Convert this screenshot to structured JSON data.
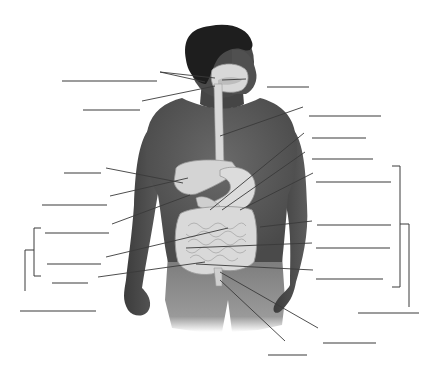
{
  "diagram": {
    "title": "",
    "colors": {
      "background": "#ffffff",
      "skin": "#4a4a4a",
      "shirt": "#5a5a5a",
      "hair": "#1e1e1e",
      "organ": "#d8d8d8",
      "organ_outline": "#9a9a9a",
      "line": "#3a3a3a"
    },
    "blank_labels": {
      "left": [
        {
          "id": "L1",
          "x1": 62,
          "x2": 157,
          "y": 81,
          "text": ""
        },
        {
          "id": "L2",
          "x1": 83,
          "x2": 140,
          "y": 110,
          "text": ""
        },
        {
          "id": "L3",
          "x1": 64,
          "x2": 101,
          "y": 173,
          "text": ""
        },
        {
          "id": "L4",
          "x1": 42,
          "x2": 107,
          "y": 205,
          "text": ""
        },
        {
          "id": "L5",
          "x1": 45,
          "x2": 109,
          "y": 233,
          "text": ""
        },
        {
          "id": "L6",
          "x1": 47,
          "x2": 101,
          "y": 264,
          "text": ""
        },
        {
          "id": "L7",
          "x1": 52,
          "x2": 88,
          "y": 283,
          "text": ""
        },
        {
          "id": "L8",
          "x1": 20,
          "x2": 96,
          "y": 311,
          "text": ""
        }
      ],
      "right": [
        {
          "id": "R1",
          "x1": 267,
          "x2": 309,
          "y": 87,
          "text": ""
        },
        {
          "id": "R2",
          "x1": 309,
          "x2": 381,
          "y": 116,
          "text": ""
        },
        {
          "id": "R3",
          "x1": 312,
          "x2": 366,
          "y": 138,
          "text": ""
        },
        {
          "id": "R4",
          "x1": 312,
          "x2": 373,
          "y": 159,
          "text": ""
        },
        {
          "id": "R5",
          "x1": 316,
          "x2": 391,
          "y": 182,
          "text": ""
        },
        {
          "id": "R6",
          "x1": 317,
          "x2": 391,
          "y": 225,
          "text": ""
        },
        {
          "id": "R7",
          "x1": 316,
          "x2": 390,
          "y": 248,
          "text": ""
        },
        {
          "id": "R8",
          "x1": 316,
          "x2": 383,
          "y": 279,
          "text": ""
        },
        {
          "id": "R9",
          "x1": 358,
          "x2": 419,
          "y": 313,
          "text": ""
        },
        {
          "id": "R10",
          "x1": 323,
          "x2": 376,
          "y": 343,
          "text": ""
        },
        {
          "id": "R11",
          "x1": 268,
          "x2": 307,
          "y": 355,
          "text": ""
        }
      ]
    },
    "leader_lines": [
      {
        "from": [
          160,
          72
        ],
        "to": [
          215,
          78
        ]
      },
      {
        "from": [
          160,
          72
        ],
        "to": [
          205,
          82
        ]
      },
      {
        "from": [
          142,
          101
        ],
        "to": [
          215,
          86
        ]
      },
      {
        "from": [
          106,
          168
        ],
        "to": [
          183,
          183
        ]
      },
      {
        "from": [
          110,
          196
        ],
        "to": [
          188,
          178
        ]
      },
      {
        "from": [
          112,
          224
        ],
        "to": [
          190,
          195
        ]
      },
      {
        "from": [
          106,
          257
        ],
        "to": [
          228,
          228
        ]
      },
      {
        "from": [
          98,
          277
        ],
        "to": [
          205,
          262
        ]
      },
      {
        "from": [
          246,
          79
        ],
        "to": [
          222,
          80
        ]
      },
      {
        "from": [
          303,
          107
        ],
        "to": [
          220,
          136
        ]
      },
      {
        "from": [
          304,
          133
        ],
        "to": [
          210,
          210
        ]
      },
      {
        "from": [
          305,
          152
        ],
        "to": [
          222,
          210
        ]
      },
      {
        "from": [
          313,
          173
        ],
        "to": [
          240,
          210
        ]
      },
      {
        "from": [
          312,
          221
        ],
        "to": [
          260,
          227
        ]
      },
      {
        "from": [
          312,
          243
        ],
        "to": [
          186,
          248
        ]
      },
      {
        "from": [
          313,
          270
        ],
        "to": [
          196,
          264
        ]
      },
      {
        "from": [
          318,
          328
        ],
        "to": [
          220,
          272
        ]
      },
      {
        "from": [
          285,
          341
        ],
        "to": [
          220,
          280
        ]
      }
    ],
    "brackets": {
      "left_inner": {
        "x": 34,
        "y1": 228,
        "y2": 276
      },
      "left_outer": {
        "x": 25,
        "y1": 250,
        "y2": 291
      },
      "right_inner": {
        "x": 400,
        "y1": 166,
        "y2": 287
      },
      "right_outer": {
        "x": 409,
        "y1": 224,
        "y2": 307
      }
    }
  }
}
